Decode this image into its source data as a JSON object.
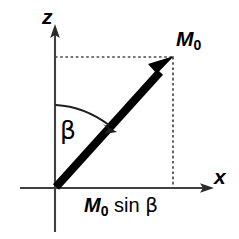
{
  "figure": {
    "type": "vector-diagram",
    "background_color": "#ffffff",
    "stroke_color": "#000000",
    "axis_color": "#444444"
  },
  "axes": {
    "vertical": {
      "name": "z-axis",
      "label": "z",
      "arrow_direction": "up"
    },
    "horizontal": {
      "name": "x-axis",
      "label": "x",
      "arrow_direction": "right"
    },
    "origin_label": ""
  },
  "vector": {
    "name": "magnetization-vector",
    "tip_label_main": "M",
    "tip_label_sub": "0",
    "angle_from_z_degrees": 45,
    "style": "thick-solid-black-arrow"
  },
  "angle": {
    "name": "beta-angle",
    "symbol": "β",
    "arc_style": "curved-arrow-from-z-axis-to-vector"
  },
  "projection": {
    "name": "x-projection",
    "label_parts": {
      "magnitude": "M",
      "subscript": "0",
      "function": "sin",
      "variable": "β"
    },
    "label_full": "M0 sin β",
    "guide_lines": "dotted"
  },
  "colors": {
    "ink": "#000000",
    "axis": "#3f3f3f",
    "guide": "#555555"
  }
}
